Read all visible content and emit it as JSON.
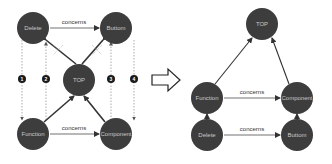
{
  "colors": {
    "node_fill": "#3d3d3d",
    "node_text": "#c9c9c9",
    "edge": "#333333",
    "dashed": "#777777",
    "cross": "#999999",
    "badge": "#1a1a1a"
  },
  "left_graph": {
    "nodes": {
      "delete": "Delete",
      "buttom": "Buttom",
      "top": "TOP",
      "function": "Function",
      "component": "Component"
    },
    "edge_labels": {
      "top_concerns": "concerns",
      "bottom_concerns": "concerns"
    },
    "badges": [
      "1",
      "2",
      "3",
      "4"
    ]
  },
  "transform_arrow": "right-double-arrow",
  "right_graph": {
    "nodes": {
      "top": "TOP",
      "function": "Function",
      "component": "Component",
      "delete": "Delete",
      "buttom": "Buttom"
    },
    "edge_labels": {
      "top_concerns": "concerns",
      "bottom_concerns": "concerns"
    }
  }
}
